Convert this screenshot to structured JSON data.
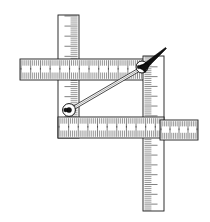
{
  "figure": {
    "background_color": "#ffffff",
    "line_color": "#1a1a1a",
    "stylus_color": "#111111",
    "width": 210,
    "height": 222
  },
  "parts": {
    "vertical_ruler_left": {
      "name": "left vertical graduated bar",
      "x": 58,
      "y": 15,
      "width": 21,
      "height": 123,
      "orientation": "vertical",
      "tick_edge": "right",
      "major_tick_count": 12,
      "minor_tick_count": 60
    },
    "vertical_ruler_right": {
      "name": "right vertical graduated bar",
      "x": 143,
      "y": 56,
      "width": 21,
      "height": 155,
      "orientation": "vertical",
      "tick_edge": "left",
      "major_tick_count": 16,
      "minor_tick_count": 78
    },
    "horizontal_ruler_top": {
      "name": "upper horizontal graduated bar",
      "x": 20,
      "y": 59,
      "width": 138,
      "height": 21,
      "orientation": "horizontal",
      "tick_edge": "both",
      "major_tick_count": 14,
      "minor_tick_count": 70
    },
    "horizontal_ruler_bottom": {
      "name": "lower horizontal graduated bar",
      "x": 58,
      "y": 117,
      "width": 106,
      "height": 21,
      "orientation": "horizontal",
      "tick_edge": "both",
      "major_tick_count": 11,
      "minor_tick_count": 54
    },
    "horizontal_ruler_right_stub": {
      "name": "detached right horizontal graduated bar",
      "x": 160,
      "y": 120,
      "width": 38,
      "height": 20,
      "orientation": "horizontal",
      "tick_edge": "both",
      "major_tick_count": 9,
      "minor_tick_count": 20
    },
    "diagonal_arm": {
      "name": "diagonal linkage arm",
      "x1": 70,
      "y1": 110,
      "x2": 142,
      "y2": 68,
      "thickness": 3.2
    },
    "pivot_lower": {
      "name": "lower pivot joint",
      "cx": 69,
      "cy": 110,
      "radius": 6.4
    },
    "pivot_upper": {
      "name": "upper pivot joint",
      "cx": 142,
      "cy": 67,
      "radius": 6.0
    },
    "stylus": {
      "name": "pointer stylus",
      "tip_x": 166,
      "tip_y": 48,
      "base_x": 143,
      "base_y": 68,
      "color": "#111111"
    }
  },
  "labels": {
    "figure_caption": "",
    "part_callouts": []
  }
}
